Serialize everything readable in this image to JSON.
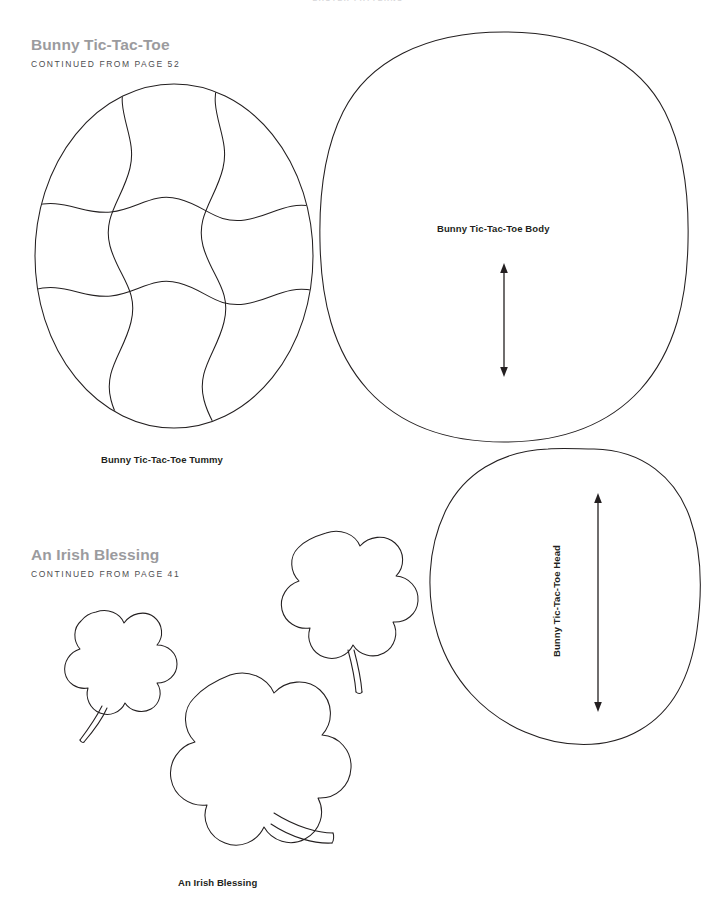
{
  "page": {
    "running_head": "EASTER PATTERNS",
    "background_color": "#ffffff",
    "ink_color": "#231f20",
    "heading_color": "#9b9b9e",
    "width": 716,
    "height": 899
  },
  "sections": [
    {
      "id": "bunny-tic-tac-toe",
      "title": "Bunny Tic-Tac-Toe",
      "continued": "CONTINUED FROM PAGE 52"
    },
    {
      "id": "an-irish-blessing",
      "title": "An Irish Blessing",
      "continued": "CONTINUED FROM PAGE 41"
    }
  ],
  "pieces": {
    "tummy": {
      "label": "Bunny Tic-Tac-Toe Tummy",
      "shape": "ellipse",
      "grid": "3x3 wavy puzzle grid"
    },
    "body": {
      "label": "Bunny Tic-Tac-Toe Body",
      "shape": "squircle",
      "grainline": "double-arrow-vertical"
    },
    "head": {
      "label": "Bunny Tic-Tac-Toe Head",
      "shape": "egg-oval",
      "grainline": "double-arrow-vertical",
      "label_rotation": "-90"
    },
    "shamrock": {
      "label": "An Irish Blessing",
      "count": 3,
      "shape": "three-leaf-clover-with-stem"
    }
  }
}
